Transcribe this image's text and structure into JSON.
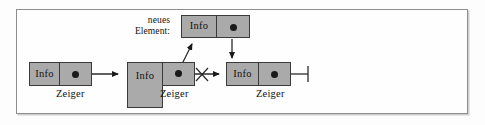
{
  "figure": {
    "language": "de",
    "colors": {
      "node_fill": "#aaaaaa",
      "node_border": "#3a3a3a",
      "frame_border": "#8e8e8e",
      "background": "#fefefe",
      "ink": "#111111"
    }
  },
  "labels": {
    "new_element_line1": "neues",
    "new_element_line2": "Element:"
  },
  "nodes": [
    {
      "id": "node-left",
      "info_label": "Info",
      "pointer_label": "Zeiger",
      "pointer_marker": "dot",
      "role": "vorgaenger"
    },
    {
      "id": "node-middle",
      "info_label": "Info",
      "pointer_label": "Zeiger",
      "pointer_marker": "dot",
      "role": "einfuegestelle"
    },
    {
      "id": "node-new",
      "info_label": "Info",
      "pointer_label": "",
      "pointer_marker": "dot",
      "role": "neues-element"
    },
    {
      "id": "node-right",
      "info_label": "Info",
      "pointer_label": "Zeiger",
      "pointer_marker": "dot",
      "role": "nachfolger"
    }
  ],
  "edges": [
    {
      "id": "edge-left-to-middle",
      "from": "node-left",
      "to": "node-middle",
      "style": "solid-arrow",
      "crossed_out": false
    },
    {
      "id": "edge-middle-to-new",
      "from": "node-middle",
      "to": "node-new",
      "style": "solid-arrow-diagonal",
      "crossed_out": false
    },
    {
      "id": "edge-new-to-right",
      "from": "node-new",
      "to": "node-right",
      "style": "solid-arrow-down",
      "crossed_out": false
    },
    {
      "id": "edge-middle-to-right",
      "from": "node-middle",
      "to": "node-right",
      "style": "solid-arrow",
      "crossed_out": true
    }
  ],
  "terminator": {
    "id": "null-terminator",
    "symbol": "ground-bar",
    "attached_to": "node-right"
  }
}
